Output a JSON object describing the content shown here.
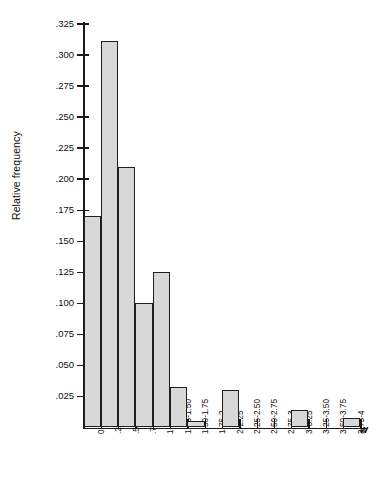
{
  "chart_data": {
    "type": "bar",
    "title": "",
    "subtitle": "",
    "xlabel": "w",
    "ylabel": "Relative frequency",
    "grid": false,
    "legend": false,
    "ylim": [
      0,
      0.3375
    ],
    "ytick_labels": [
      ".325",
      ".300",
      ".275",
      ".250",
      ".225",
      ".200",
      ".175",
      ".150",
      ".125",
      ".100",
      ".075",
      ".050",
      ".025"
    ],
    "ytick_values": [
      0.325,
      0.3,
      0.275,
      0.25,
      0.225,
      0.2,
      0.175,
      0.15,
      0.125,
      0.1,
      0.075,
      0.05,
      0.025
    ],
    "categories": [
      "0-.25",
      ".25-.50",
      ".50-.75",
      ".75-1",
      "1-1.25",
      "1.25-1.50",
      "1.50-1.75",
      "1.75-2",
      "2-2.25",
      "2.25-2.50",
      "2.50-2.75",
      "2.75-3",
      "3-3.25",
      "3.25-3.50",
      "3.50-3.75",
      "3.75-4"
    ],
    "values": [
      0.17,
      0.311,
      0.21,
      0.1,
      0.125,
      0.033,
      0.005,
      0.0,
      0.03,
      0.0,
      0.0,
      0.0,
      0.014,
      0.0,
      0.0,
      0.008
    ]
  },
  "style": {
    "bar_fill": "#d8d8d8",
    "bar_edge": "#1f1f1f",
    "axis_color": "#1a1a1a",
    "text_color": "#0d0d0d",
    "background": "#ffffff"
  }
}
